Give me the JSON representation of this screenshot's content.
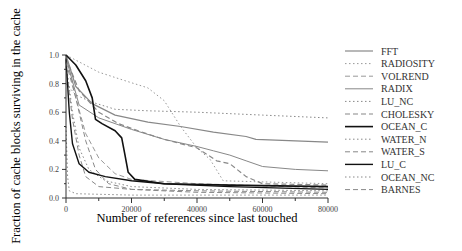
{
  "chart_data": {
    "type": "line",
    "title": "",
    "xlabel": "Number of references since last touched",
    "ylabel": "Fraction of cache blocks surviving in the cache",
    "xlim": [
      0,
      80000
    ],
    "ylim": [
      0.0,
      1.0
    ],
    "x_ticks": [
      "0",
      "20000",
      "40000",
      "60000",
      "80000"
    ],
    "y_ticks": [
      "0.0",
      "0.2",
      "0.4",
      "0.6",
      "0.8",
      "1.0"
    ],
    "grid": false,
    "legend_position": "right",
    "series": [
      {
        "name": "FFT",
        "style": "solid",
        "color": "#888888",
        "width": 1.2,
        "points": [
          [
            0,
            1.0
          ],
          [
            3000,
            0.78
          ],
          [
            8000,
            0.66
          ],
          [
            15000,
            0.58
          ],
          [
            25000,
            0.53
          ],
          [
            35000,
            0.5
          ],
          [
            45000,
            0.46
          ],
          [
            55000,
            0.43
          ],
          [
            58000,
            0.41
          ],
          [
            70000,
            0.4
          ],
          [
            80000,
            0.39
          ]
        ]
      },
      {
        "name": "RADIOSITY",
        "style": "dotted",
        "color": "#999999",
        "width": 1.0,
        "points": [
          [
            0,
            1.0
          ],
          [
            5000,
            0.94
          ],
          [
            10000,
            0.88
          ],
          [
            18000,
            0.82
          ],
          [
            25000,
            0.77
          ],
          [
            30000,
            0.68
          ],
          [
            35000,
            0.5
          ],
          [
            40000,
            0.35
          ],
          [
            44000,
            0.27
          ],
          [
            48000,
            0.12
          ],
          [
            80000,
            0.1
          ]
        ]
      },
      {
        "name": "VOLREND",
        "style": "dashed",
        "color": "#999999",
        "width": 1.0,
        "points": [
          [
            0,
            1.0
          ],
          [
            3000,
            0.7
          ],
          [
            6000,
            0.45
          ],
          [
            10000,
            0.28
          ],
          [
            15000,
            0.17
          ],
          [
            20000,
            0.13
          ],
          [
            40000,
            0.1
          ],
          [
            80000,
            0.07
          ]
        ]
      },
      {
        "name": "RADIX",
        "style": "solid",
        "color": "#888888",
        "width": 1.0,
        "points": [
          [
            0,
            0.98
          ],
          [
            4000,
            0.65
          ],
          [
            10000,
            0.56
          ],
          [
            20000,
            0.48
          ],
          [
            30000,
            0.41
          ],
          [
            40000,
            0.36
          ],
          [
            45000,
            0.33
          ],
          [
            50000,
            0.3
          ],
          [
            55000,
            0.26
          ],
          [
            60000,
            0.22
          ],
          [
            70000,
            0.2
          ],
          [
            80000,
            0.19
          ]
        ]
      },
      {
        "name": "LU_NC",
        "style": "dotted",
        "color": "#888888",
        "width": 1.0,
        "points": [
          [
            0,
            0.8
          ],
          [
            3000,
            0.72
          ],
          [
            8000,
            0.67
          ],
          [
            15000,
            0.62
          ],
          [
            25000,
            0.61
          ],
          [
            40000,
            0.6
          ],
          [
            60000,
            0.58
          ],
          [
            80000,
            0.56
          ]
        ]
      },
      {
        "name": "CHOLESKY",
        "style": "dashed",
        "color": "#888888",
        "width": 1.2,
        "points": [
          [
            0,
            0.98
          ],
          [
            4000,
            0.75
          ],
          [
            10000,
            0.6
          ],
          [
            16000,
            0.52
          ],
          [
            22000,
            0.47
          ],
          [
            30000,
            0.41
          ],
          [
            35000,
            0.38
          ],
          [
            40000,
            0.35
          ],
          [
            46000,
            0.26
          ],
          [
            50000,
            0.24
          ],
          [
            55000,
            0.15
          ],
          [
            60000,
            0.1
          ],
          [
            80000,
            0.09
          ]
        ]
      },
      {
        "name": "OCEAN_C",
        "style": "solid",
        "color": "#111111",
        "width": 1.6,
        "points": [
          [
            0,
            1.0
          ],
          [
            3000,
            0.93
          ],
          [
            6000,
            0.82
          ],
          [
            8000,
            0.7
          ],
          [
            9000,
            0.55
          ],
          [
            11000,
            0.52
          ],
          [
            15000,
            0.47
          ],
          [
            17000,
            0.42
          ],
          [
            18000,
            0.3
          ],
          [
            19000,
            0.18
          ],
          [
            21000,
            0.13
          ],
          [
            30000,
            0.1
          ],
          [
            50000,
            0.09
          ],
          [
            80000,
            0.08
          ]
        ]
      },
      {
        "name": "WATER_N",
        "style": "dotted",
        "color": "#888888",
        "width": 1.0,
        "points": [
          [
            0,
            0.95
          ],
          [
            2000,
            0.6
          ],
          [
            4000,
            0.35
          ],
          [
            7000,
            0.2
          ],
          [
            12000,
            0.12
          ],
          [
            20000,
            0.08
          ],
          [
            40000,
            0.06
          ],
          [
            80000,
            0.05
          ]
        ]
      },
      {
        "name": "WATER_S",
        "style": "dashed",
        "color": "#888888",
        "width": 1.0,
        "points": [
          [
            0,
            0.92
          ],
          [
            2000,
            0.55
          ],
          [
            4000,
            0.3
          ],
          [
            6000,
            0.15
          ],
          [
            10000,
            0.08
          ],
          [
            20000,
            0.06
          ],
          [
            40000,
            0.05
          ],
          [
            80000,
            0.04
          ]
        ]
      },
      {
        "name": "LU_C",
        "style": "solid",
        "color": "#111111",
        "width": 1.4,
        "points": [
          [
            0,
            0.97
          ],
          [
            1000,
            0.6
          ],
          [
            2000,
            0.38
          ],
          [
            4000,
            0.24
          ],
          [
            7000,
            0.18
          ],
          [
            12000,
            0.15
          ],
          [
            20000,
            0.12
          ],
          [
            30000,
            0.1
          ],
          [
            50000,
            0.08
          ],
          [
            80000,
            0.06
          ]
        ]
      },
      {
        "name": "OCEAN_NC",
        "style": "dotted",
        "color": "#888888",
        "width": 1.0,
        "points": [
          [
            0,
            0.5
          ],
          [
            500,
            0.15
          ],
          [
            1000,
            0.05
          ],
          [
            3000,
            0.03
          ],
          [
            20000,
            0.02
          ],
          [
            80000,
            0.02
          ]
        ]
      },
      {
        "name": "BARNES",
        "style": "dashed",
        "color": "#888888",
        "width": 1.0,
        "points": [
          [
            0,
            0.95
          ],
          [
            3000,
            0.7
          ],
          [
            6000,
            0.4
          ],
          [
            9000,
            0.2
          ],
          [
            13000,
            0.1
          ],
          [
            20000,
            0.06
          ],
          [
            40000,
            0.04
          ],
          [
            80000,
            0.03
          ]
        ]
      }
    ]
  }
}
